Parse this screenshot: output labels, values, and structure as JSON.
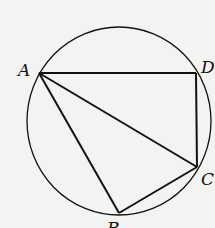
{
  "diagram": {
    "type": "cyclic-quadrilateral",
    "circle": {
      "cx": 119,
      "cy": 121,
      "rx": 92,
      "ry": 94
    },
    "points": {
      "A": {
        "label": "A",
        "x": 39,
        "y": 73
      },
      "D": {
        "label": "D",
        "x": 196,
        "y": 73
      },
      "C": {
        "label": "C",
        "x": 197,
        "y": 167
      },
      "B": {
        "label": "B",
        "x": 119,
        "y": 213
      }
    },
    "segments": [
      "AD",
      "DC",
      "AC",
      "AB",
      "BC"
    ],
    "stroke_color": "#111111",
    "background_color": "#f3f3f1"
  }
}
